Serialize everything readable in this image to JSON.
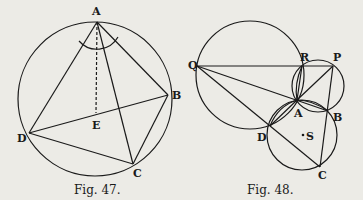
{
  "figures": [
    {
      "caption": "Fig. 47.",
      "points": {
        "A": "A",
        "B": "B",
        "C": "C",
        "D": "D",
        "E": "E"
      }
    },
    {
      "caption": "Fig. 48.",
      "points": {
        "Q": "Q",
        "R": "R",
        "P": "P",
        "A": "A",
        "B": "B",
        "D": "D",
        "S": "S",
        "C": "C"
      }
    }
  ],
  "colors": {
    "ink": "#1a1a1a",
    "paper": "#ecebe6"
  }
}
